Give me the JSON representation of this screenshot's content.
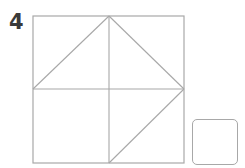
{
  "problem": {
    "number": "4",
    "figure": {
      "type": "square-dissection",
      "stroke_color": "#a8a8a8",
      "outer_square": {
        "x1": 33,
        "y1": 16,
        "x2": 184,
        "y2": 163
      },
      "lines": [
        {
          "name": "vertical-midline",
          "x1": 109,
          "y1": 16,
          "x2": 109,
          "y2": 163
        },
        {
          "name": "horizontal-midline",
          "x1": 33,
          "y1": 89,
          "x2": 184,
          "y2": 89
        },
        {
          "name": "diagonal-left-mid-to-top-center",
          "x1": 33,
          "y1": 89,
          "x2": 109,
          "y2": 16
        },
        {
          "name": "diagonal-top-center-to-right-mid",
          "x1": 109,
          "y1": 16,
          "x2": 184,
          "y2": 89
        },
        {
          "name": "diagonal-right-mid-to-bottom-center",
          "x1": 184,
          "y1": 89,
          "x2": 109,
          "y2": 163
        }
      ]
    },
    "answer_box": {
      "value": ""
    }
  }
}
